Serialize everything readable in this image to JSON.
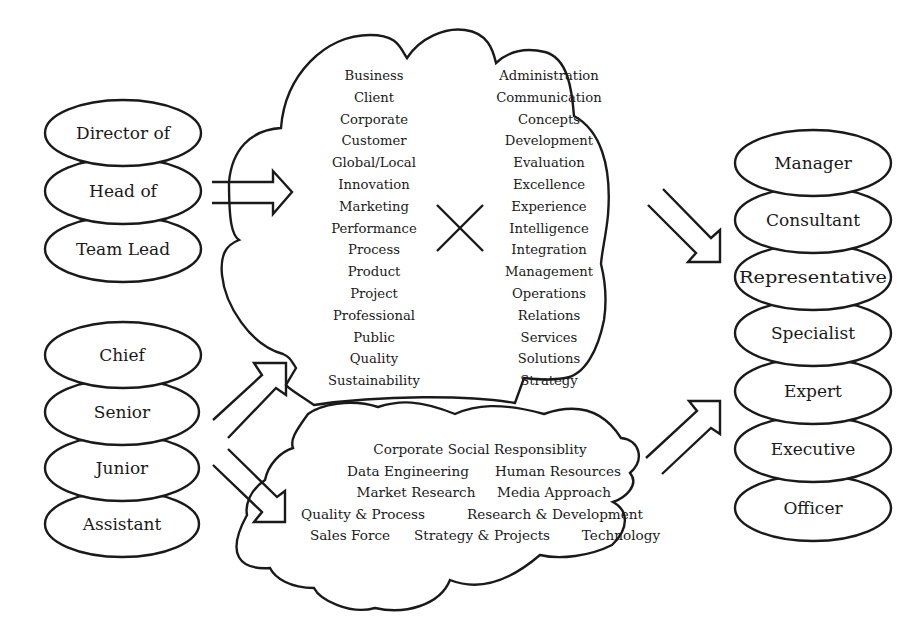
{
  "diagram": {
    "left_top_group": {
      "items": [
        "Director of",
        "Head of",
        "Team Lead"
      ]
    },
    "left_bottom_group": {
      "items": [
        "Chief",
        "Senior",
        "Junior",
        "Assistant"
      ]
    },
    "top_cloud": {
      "left_column": [
        "Business",
        "Client",
        "Corporate",
        "Customer",
        "Global/Local",
        "Innovation",
        "Marketing",
        "Performance",
        "Process",
        "Product",
        "Project",
        "Professional",
        "Public",
        "Quality",
        "Sustainability"
      ],
      "cross_symbol": "multiply-icon",
      "right_column": [
        "Administration",
        "Communication",
        "Concepts",
        "Development",
        "Evaluation",
        "Excellence",
        "Experience",
        "Intelligence",
        "Integration",
        "Management",
        "Operations",
        "Relations",
        "Services",
        "Solutions",
        "Strategy"
      ]
    },
    "bottom_cloud": {
      "rows": [
        [
          "Corporate Social Responsiblity"
        ],
        [
          "Data Engineering",
          "Human Resources"
        ],
        [
          "Market Research",
          "Media Approach"
        ],
        [
          "Quality & Process",
          "Research & Development"
        ],
        [
          "Sales Force",
          "Strategy & Projects",
          "Technology"
        ]
      ]
    },
    "right_group": {
      "items": [
        "Manager",
        "Consultant",
        "Representative",
        "Specialist",
        "Expert",
        "Executive",
        "Officer"
      ]
    },
    "arrows": [
      {
        "from": "left_top_group",
        "to": "top_cloud",
        "direction": "right"
      },
      {
        "from": "left_bottom_group",
        "to": "top_cloud",
        "direction": "up-right"
      },
      {
        "from": "left_bottom_group",
        "to": "bottom_cloud",
        "direction": "down-right"
      },
      {
        "from": "top_cloud",
        "to": "right_group",
        "direction": "down-right"
      },
      {
        "from": "bottom_cloud",
        "to": "right_group",
        "direction": "up-right"
      }
    ],
    "colors": {
      "stroke": "#1a1a1a",
      "fill": "#ffffff",
      "background": "#ffffff"
    }
  }
}
